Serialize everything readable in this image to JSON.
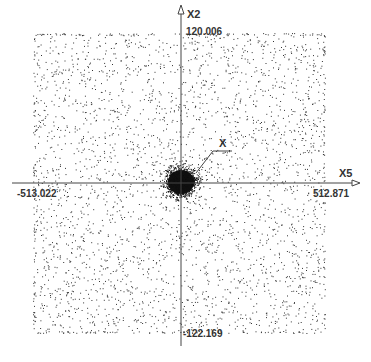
{
  "chart_data": {
    "type": "scatter",
    "title": "",
    "xlabel": "X5",
    "ylabel": "X2",
    "xlim": [
      -513.022,
      512.871
    ],
    "ylim": [
      -122.169,
      120.006
    ],
    "tick_labels": {
      "x_min": "-513.022",
      "x_max": "512.871",
      "y_max": "120.006",
      "y_min": "-122.169"
    },
    "annotations": [
      {
        "text": "X",
        "points_to": "dense central cluster near origin"
      }
    ],
    "grid": false,
    "legend": null,
    "series": [
      {
        "name": "uniform background points",
        "distribution": "uniform",
        "x_range": [
          -513.022,
          512.871
        ],
        "y_range": [
          -122.169,
          120.006
        ],
        "approx_count": 3000
      },
      {
        "name": "central cluster",
        "distribution": "gaussian",
        "center": [
          0,
          0
        ],
        "approx_count": 1500
      }
    ]
  },
  "axes": {
    "x_name": "X5",
    "y_name": "X2",
    "x_min_label": "-513.022",
    "x_max_label": "512.871",
    "y_max_label": "120.006",
    "y_min_label": "-122.169",
    "annotation_label": "X"
  },
  "colors": {
    "points": "#333333",
    "axes": "#444444",
    "background": "#ffffff"
  }
}
